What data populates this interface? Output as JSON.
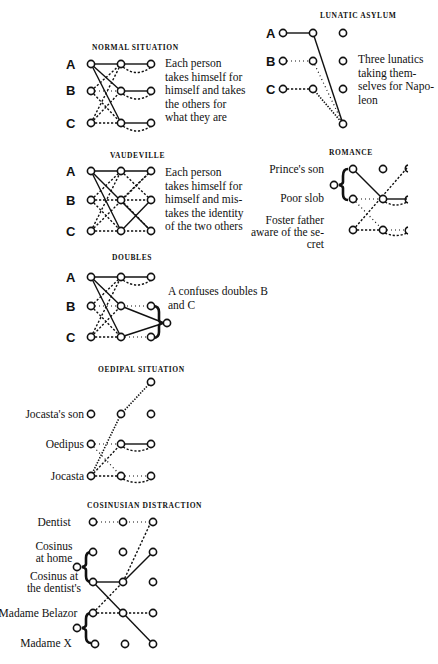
{
  "diagrams": {
    "normal": {
      "title": "NORMAL SITUATION",
      "rows": [
        "A",
        "B",
        "C"
      ],
      "description": "Each person takes himself for himself and takes the others for what they are"
    },
    "lunatic": {
      "title": "LUNATIC ASYLUM",
      "rows": [
        "A",
        "B",
        "C"
      ],
      "description": "Three lunatics taking themselves for Napoleon"
    },
    "vaudeville": {
      "title": "VAUDEVILLE",
      "rows": [
        "A",
        "B",
        "C"
      ],
      "description": "Each person takes himself for himself and mistakes the identity of the two others"
    },
    "romance": {
      "title": "ROMANCE",
      "rows": [
        "Prince's son",
        "Poor slob",
        "Foster father aware of the secret"
      ]
    },
    "doubles": {
      "title": "DOUBLES",
      "rows": [
        "A",
        "B",
        "C"
      ],
      "description": "A confuses doubles B and C"
    },
    "oedipal": {
      "title": "OEDIPAL SITUATION",
      "rows": [
        "Jocasta's son",
        "Oedipus",
        "Jocasta"
      ]
    },
    "cosinusian": {
      "title": "COSINUSIAN DISTRACTION",
      "rows": [
        "Dentist",
        "Cosinus at home",
        "Cosinus at the dentist's",
        "Madame Belazor",
        "Madame X"
      ]
    }
  },
  "labels": {
    "normal_desc_lines": [
      "Each person",
      "takes himself for",
      "himself and takes",
      "the others for",
      "what they are"
    ],
    "lunatic_desc_lines": [
      "Three lunatics",
      "taking them-",
      "selves for Napo-",
      "leon"
    ],
    "vaudeville_desc_lines": [
      "Each person",
      "takes himself for",
      "himself and mis-",
      "takes the identity",
      "of the two others"
    ],
    "doubles_desc_lines": [
      "A confuses doubles B",
      "and C"
    ],
    "romance_row_lines": [
      "Prince's son",
      "Poor slob",
      "Foster father",
      "aware of the se-",
      "cret"
    ],
    "cosinus_row_lines": [
      "Dentist",
      "Cosinus",
      "at home",
      "Cosinus at",
      "the dentist's",
      "Madame Belazor",
      "Madame X"
    ],
    "plus_marks": "+ + +"
  }
}
